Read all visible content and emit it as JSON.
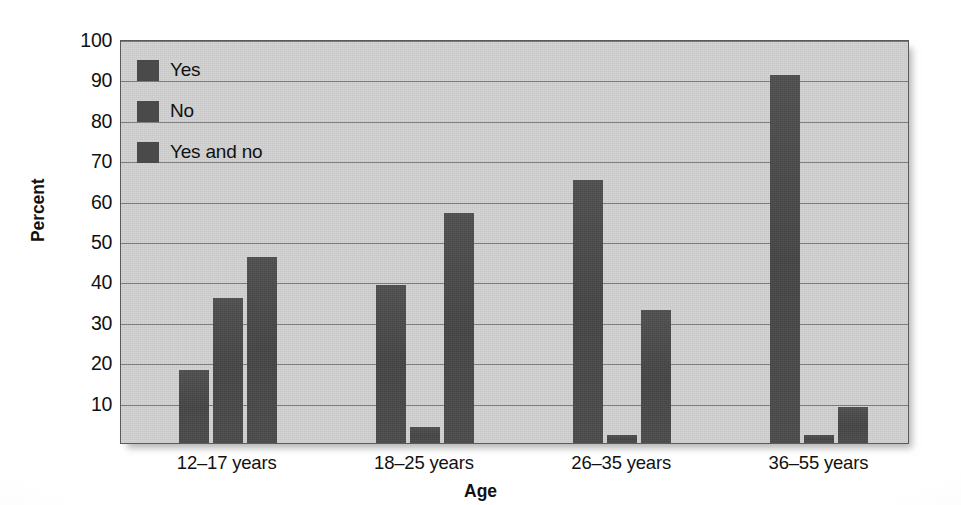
{
  "chart_data": {
    "type": "bar",
    "title": "",
    "xlabel": "Age",
    "ylabel": "Percent",
    "categories": [
      "12–17 years",
      "18–25 years",
      "26–35 years",
      "36–55 years"
    ],
    "series": [
      {
        "name": "Yes",
        "values": [
          18,
          39,
          65,
          91
        ]
      },
      {
        "name": "No",
        "values": [
          36,
          4,
          2,
          2
        ]
      },
      {
        "name": "Yes and no",
        "values": [
          46,
          57,
          33,
          9
        ]
      }
    ],
    "ylim": [
      0,
      100
    ],
    "yticks": [
      100,
      90,
      80,
      70,
      60,
      50,
      40,
      30,
      20,
      10
    ],
    "ytick_labels": [
      "100",
      "90",
      "80",
      "70",
      "60",
      "50",
      "40",
      "30",
      "20",
      "10"
    ],
    "grid": true,
    "legend_position": "top-left-inside",
    "colors": {
      "bar": "#4a4a4a",
      "panel_background": "#d2d2d2",
      "gridline": "#6d6d6d",
      "axis": "#5a5a5a",
      "text": "#111111",
      "page_background": "#ffffff"
    }
  },
  "legend": {
    "items": [
      {
        "label": "Yes",
        "swatch": "legend-swatch-yes"
      },
      {
        "label": "No",
        "swatch": "legend-swatch-no"
      },
      {
        "label": "Yes and no",
        "swatch": "legend-swatch-yes-and-no"
      }
    ]
  }
}
